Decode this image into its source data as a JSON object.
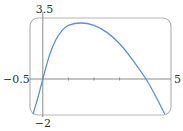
{
  "chart_data": {
    "type": "line",
    "title": "",
    "xlabel": "",
    "ylabel": "",
    "function_label": "not shown in image; shape estimated from pixels",
    "xlim": [
      -0.5,
      5
    ],
    "ylim": [
      -2,
      3.5
    ],
    "grid": false,
    "legend": null,
    "tick_labels": {
      "xmin": "−0.5",
      "xmax": "5",
      "ymin": "−2",
      "ymax": "3.5"
    },
    "x_ticks_unlabeled": [
      1,
      2,
      3
    ],
    "series": [
      {
        "name": "curve",
        "color": "#5b8fd6",
        "points_estimated": [
          {
            "x": -0.38,
            "y": -2.0
          },
          {
            "x": -0.2,
            "y": -1.1
          },
          {
            "x": 0.0,
            "y": 0.0
          },
          {
            "x": 0.25,
            "y": 1.3
          },
          {
            "x": 0.5,
            "y": 2.2
          },
          {
            "x": 0.75,
            "y": 2.75
          },
          {
            "x": 1.0,
            "y": 3.05
          },
          {
            "x": 1.49,
            "y": 3.18
          },
          {
            "x": 2.0,
            "y": 3.05
          },
          {
            "x": 2.5,
            "y": 2.65
          },
          {
            "x": 3.0,
            "y": 2.0
          },
          {
            "x": 3.5,
            "y": 1.1
          },
          {
            "x": 4.03,
            "y": 0.0
          },
          {
            "x": 4.4,
            "y": -0.95
          },
          {
            "x": 4.77,
            "y": -2.0
          }
        ]
      }
    ]
  },
  "pixel_map": {
    "frame": {
      "left": 30,
      "top": 18,
      "right": 171,
      "bottom": 115,
      "radius": 8
    },
    "x_origin_px": 42.8,
    "y_origin_px": 79,
    "px_per_x": 25.6,
    "px_per_y": 17.6
  },
  "colors": {
    "frame": "#b5b5b5",
    "axis": "#8a8a8a",
    "curve": "#5b8fd6",
    "text": "#333333"
  }
}
